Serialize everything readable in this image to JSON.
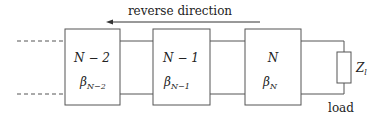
{
  "diagram": {
    "arrow_label": "reverse direction",
    "blocks": [
      {
        "index": "N − 2",
        "beta": "β",
        "beta_sub": "N−2"
      },
      {
        "index": "N − 1",
        "beta": "β",
        "beta_sub": "N−1"
      },
      {
        "index": "N",
        "beta": "β",
        "beta_sub": "N"
      }
    ],
    "load": {
      "symbol": "Z",
      "symbol_sub": "l",
      "label": "load"
    },
    "colors": {
      "line": "#555555",
      "text": "#222222",
      "background": "#ffffff"
    }
  }
}
